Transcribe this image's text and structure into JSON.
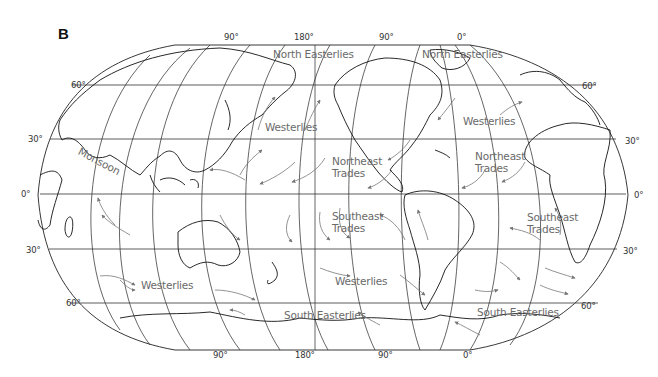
{
  "figure": {
    "panel_label": "B",
    "colors": {
      "outline": "#222222",
      "coast": "#111111",
      "grid": "#333333",
      "wind_arrow": "#777777",
      "wind_label": "#6a6a6a"
    }
  },
  "longitude_ticks_top": [
    "90°",
    "180°",
    "90°",
    "0°"
  ],
  "longitude_ticks_bottom": [
    "90°",
    "180°",
    "90°",
    "0°"
  ],
  "latitude_ticks_left": [
    "60°",
    "30°",
    "0°",
    "30°",
    "60°"
  ],
  "latitude_ticks_right": [
    "60°",
    "30°",
    "0°",
    "30°",
    "60°"
  ],
  "wind_labels": {
    "north_easterlies_pacific": "North Easterlies",
    "north_easterlies_atlantic": "North Easterlies",
    "westerlies_north_pacific": "Westerlies",
    "westerlies_north_atlantic": "Westerlies",
    "monsoon": "Monsoon",
    "northeast_trades_pacific": "Northeast\nTrades",
    "northeast_trades_atlantic": "Northeast\nTrades",
    "southeast_trades_pacific": "Southeast\nTrades",
    "southeast_trades_atlantic": "Southeast\nTrades",
    "westerlies_south_indian": "Westerlies",
    "westerlies_south_pacific": "Westerlies",
    "south_easterlies_pacific": "South Easterlies",
    "south_easterlies_atlantic": "South Easterlies"
  }
}
